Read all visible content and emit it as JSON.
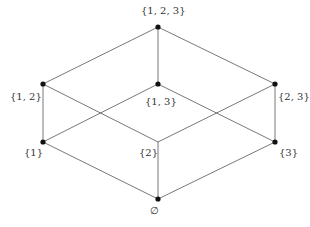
{
  "diagram": {
    "type": "hasse-diagram",
    "nodes": [
      {
        "id": "n123",
        "label": "{1, 2, 3}",
        "x": 158,
        "y": 27,
        "dot": true,
        "lx": 141,
        "ly": 5
      },
      {
        "id": "n12",
        "label": "{1, 2}",
        "x": 43,
        "y": 84,
        "dot": true,
        "lx": 10,
        "ly": 91
      },
      {
        "id": "n13",
        "label": "{1, 3}",
        "x": 158,
        "y": 84,
        "dot": true,
        "lx": 145,
        "ly": 96
      },
      {
        "id": "n23",
        "label": "{2, 3}",
        "x": 275,
        "y": 84,
        "dot": true,
        "lx": 278,
        "ly": 91
      },
      {
        "id": "n1",
        "label": "{1}",
        "x": 43,
        "y": 142,
        "dot": true,
        "lx": 24,
        "ly": 147
      },
      {
        "id": "n2",
        "label": "{2}",
        "x": 158,
        "y": 142,
        "dot": false,
        "lx": 139,
        "ly": 147
      },
      {
        "id": "n3",
        "label": "{3}",
        "x": 275,
        "y": 142,
        "dot": true,
        "lx": 279,
        "ly": 147
      },
      {
        "id": "n0",
        "label": "∅",
        "x": 158,
        "y": 199,
        "dot": true,
        "lx": 150,
        "ly": 205
      }
    ],
    "edges": [
      [
        "n123",
        "n12"
      ],
      [
        "n123",
        "n13"
      ],
      [
        "n123",
        "n23"
      ],
      [
        "n12",
        "n1"
      ],
      [
        "n12",
        "n2"
      ],
      [
        "n13",
        "n1"
      ],
      [
        "n13",
        "n3"
      ],
      [
        "n23",
        "n2"
      ],
      [
        "n23",
        "n3"
      ],
      [
        "n1",
        "n0"
      ],
      [
        "n2",
        "n0"
      ],
      [
        "n3",
        "n0"
      ]
    ],
    "colors": {
      "line": "#555555",
      "dot": "#111111",
      "text": "#333333"
    }
  }
}
